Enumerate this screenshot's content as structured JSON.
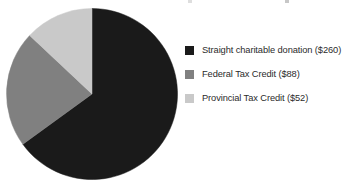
{
  "chart_data": {
    "type": "pie",
    "title": "",
    "subtitle": "",
    "xlabel": "",
    "ylabel": "",
    "grid": false,
    "legend_position": "right",
    "start_angle_deg": 0,
    "direction": "clockwise",
    "total": 400,
    "currency": "$",
    "categories": [
      "Straight charitable donation",
      "Federal Tax Credit",
      "Provincial Tax Credit"
    ],
    "values": [
      260,
      88,
      52
    ],
    "percentages": [
      65.0,
      22.0,
      13.0
    ],
    "sweep_angles_deg": [
      234.0,
      79.2,
      46.8
    ],
    "colors": [
      "#1a1a1a",
      "#808080",
      "#c9c9c9"
    ],
    "slices": [
      {
        "label": "Straight charitable donation",
        "legend_text": "Straight charitable donation ($260)",
        "value": 260,
        "percent": 65.0,
        "sweep_deg": 234.0,
        "color": "#1a1a1a"
      },
      {
        "label": "Federal Tax Credit",
        "legend_text": "Federal Tax Credit ($88)",
        "value": 88,
        "percent": 22.0,
        "sweep_deg": 79.2,
        "color": "#808080"
      },
      {
        "label": "Provincial Tax Credit",
        "legend_text": "Provincial Tax Credit ($52)",
        "value": 52,
        "percent": 13.0,
        "sweep_deg": 46.8,
        "color": "#c9c9c9"
      }
    ]
  },
  "legend": {
    "items": [
      {
        "label": "Straight charitable donation ($260)",
        "color": "#1a1a1a"
      },
      {
        "label": "Federal Tax Credit ($88)",
        "color": "#808080"
      },
      {
        "label": "Provincial Tax Credit ($52)",
        "color": "#c9c9c9"
      }
    ]
  }
}
